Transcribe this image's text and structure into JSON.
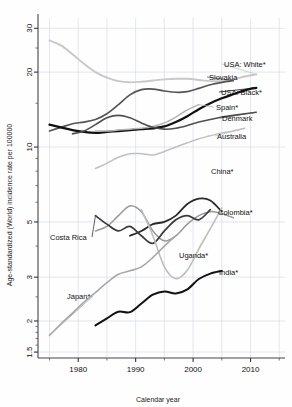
{
  "figure": {
    "background": "#fefefe",
    "frame_color": "#444444",
    "grid_color": "#d9dde6"
  },
  "axes": {
    "x": {
      "label": "Calendar year",
      "ticks": [
        1980,
        1990,
        2000,
        2010
      ],
      "tick_labels": [
        "1980",
        "1990",
        "2000",
        "2010"
      ],
      "minor_gridlines": [
        1975,
        1980,
        1985,
        1990,
        1995,
        2000,
        2005,
        2010,
        2015
      ],
      "range": [
        1973,
        2016
      ]
    },
    "y": {
      "label": "Age-standardized (World) incidence rate per 100000",
      "scale": "log",
      "ticks": [
        1.5,
        2,
        3,
        5,
        10,
        20,
        30
      ],
      "tick_labels": [
        "1.5",
        "2",
        "3",
        "5",
        "10",
        "20",
        "30"
      ],
      "range": [
        1.42,
        33
      ]
    }
  },
  "chart_data": {
    "type": "line",
    "title": "",
    "xlabel": "Calendar year",
    "ylabel": "Age-standardized (World) incidence rate per 100000",
    "xlim": [
      1973,
      2016
    ],
    "ylim": [
      1.42,
      33
    ],
    "yscale": "log",
    "grid": true,
    "legend": "inline-labels-at-line-ends",
    "series": [
      {
        "name": "USA: White*",
        "label": "USA: White*",
        "color": "#c8c8c8",
        "width": 1.9,
        "label_xy": [
          224,
          64
        ],
        "x": [
          1975,
          1977,
          1979,
          1981,
          1983,
          1985,
          1987,
          1989,
          1991,
          1993,
          1995,
          1997,
          1999,
          2001,
          2003,
          2005,
          2007,
          2009,
          2011
        ],
        "y": [
          26.8,
          25.6,
          23.6,
          21.6,
          20.0,
          19.0,
          18.4,
          18.2,
          18.3,
          18.5,
          18.7,
          18.8,
          18.8,
          18.6,
          18.4,
          18.4,
          18.7,
          19.2,
          19.6
        ]
      },
      {
        "name": "Slovakia",
        "label": "Slovakia",
        "color": "#555555",
        "width": 1.7,
        "label_xy": [
          209,
          77
        ],
        "x": [
          1975,
          1977,
          1979,
          1981,
          1983,
          1985,
          1987,
          1989,
          1991,
          1993,
          1995,
          1997,
          1999,
          2001,
          2003,
          2005,
          2007
        ],
        "y": [
          11.6,
          12.0,
          12.4,
          12.6,
          12.9,
          13.6,
          14.8,
          16.2,
          17.0,
          17.1,
          16.8,
          16.6,
          16.7,
          17.2,
          17.8,
          18.2,
          18.5
        ]
      },
      {
        "name": "USA: Black*",
        "label": "USA: Black*",
        "color": "#111111",
        "width": 2.3,
        "label_xy": [
          221,
          92
        ],
        "x": [
          1975,
          1977,
          1979,
          1981,
          1983,
          1985,
          1987,
          1989,
          1991,
          1993,
          1995,
          1997,
          1999,
          2001,
          2003,
          2005,
          2007,
          2009,
          2011
        ],
        "y": [
          12.3,
          12.0,
          11.7,
          11.5,
          11.4,
          11.5,
          11.6,
          11.7,
          11.8,
          11.9,
          12.1,
          12.6,
          13.3,
          14.2,
          15.0,
          15.7,
          16.3,
          16.9,
          17.3
        ]
      },
      {
        "name": "Spain*",
        "label": "Spain*",
        "color": "#b4b4b4",
        "width": 1.5,
        "label_xy": [
          216,
          107
        ],
        "x": [
          1983,
          1985,
          1987,
          1989,
          1991,
          1993,
          1995,
          1997,
          1999,
          2001
        ],
        "y": [
          11.6,
          11.6,
          11.7,
          11.8,
          11.9,
          12.1,
          12.5,
          13.2,
          14.1,
          14.8
        ]
      },
      {
        "name": "Denmark",
        "label": "Denmark",
        "color": "#4f4f4f",
        "width": 1.6,
        "label_xy": [
          222,
          118
        ],
        "x": [
          1979,
          1981,
          1983,
          1985,
          1987,
          1989,
          1991,
          1993,
          1995,
          1997,
          1999,
          2001,
          2003,
          2005,
          2007,
          2009,
          2011
        ],
        "y": [
          11.3,
          11.6,
          12.3,
          13.1,
          13.4,
          13.1,
          12.5,
          12.0,
          11.8,
          11.9,
          12.2,
          12.6,
          12.9,
          13.2,
          13.4,
          13.6,
          13.8
        ]
      },
      {
        "name": "Australia",
        "label": "Australia",
        "color": "#c0c0c0",
        "width": 1.5,
        "label_xy": [
          217,
          136
        ],
        "x": [
          1983,
          1985,
          1987,
          1989,
          1991,
          1993,
          1995,
          1997,
          1999,
          2001,
          2003,
          2005,
          2007,
          2009
        ],
        "y": [
          8.2,
          8.6,
          9.1,
          9.4,
          9.4,
          9.3,
          9.6,
          10.0,
          10.4,
          10.8,
          11.1,
          11.4,
          11.6,
          11.9
        ]
      },
      {
        "name": "China*",
        "label": "China*",
        "color": "#2a2a2a",
        "width": 1.8,
        "label_xy": [
          211,
          171
        ],
        "x": [
          1989,
          1991,
          1993,
          1995,
          1997,
          1999,
          2001,
          2003,
          2005
        ],
        "y": [
          4.4,
          4.6,
          4.9,
          5.0,
          5.3,
          5.9,
          6.2,
          6.1,
          5.5
        ]
      },
      {
        "name": "Colombia*",
        "label": "Colombia*",
        "color": "#9a9a9a",
        "width": 1.5,
        "label_xy": [
          218,
          212
        ],
        "x": [
          1983,
          1985,
          1987,
          1989,
          1991,
          1993,
          1995,
          1997,
          1999,
          2001,
          2003,
          2005,
          2007
        ],
        "y": [
          4.6,
          4.8,
          5.3,
          5.8,
          5.5,
          4.6,
          4.2,
          4.4,
          4.9,
          5.3,
          5.5,
          5.4,
          5.2
        ]
      },
      {
        "name": "Costa Rica",
        "label": "Costa Rica",
        "color": "#3a3a3a",
        "width": 1.7,
        "label_xy": [
          50,
          237
        ],
        "x": [
          1983,
          1985,
          1987,
          1989,
          1991,
          1993,
          1995,
          1997,
          1999,
          2001,
          2003
        ],
        "y": [
          5.3,
          4.9,
          4.6,
          4.8,
          4.4,
          4.1,
          4.6,
          5.1,
          5.3,
          5.1,
          5.6
        ]
      },
      {
        "name": "Uganda*",
        "label": "Uganda*",
        "color": "#bdbdbd",
        "width": 1.6,
        "label_xy": [
          179,
          255
        ],
        "x": [
          1991,
          1993,
          1995,
          1997,
          1999,
          2001,
          2003,
          2005
        ],
        "y": [
          5.6,
          4.4,
          3.3,
          2.96,
          3.2,
          3.9,
          4.7,
          5.7
        ]
      },
      {
        "name": "India*",
        "label": "India*",
        "color": "#111111",
        "width": 2.0,
        "label_xy": [
          219,
          272
        ],
        "x": [
          1983,
          1985,
          1987,
          1989,
          1991,
          1993,
          1995,
          1997,
          1999,
          2001,
          2003,
          2005
        ],
        "y": [
          1.92,
          2.05,
          2.18,
          2.17,
          2.35,
          2.55,
          2.63,
          2.58,
          2.68,
          2.95,
          3.1,
          3.18
        ]
      },
      {
        "name": "Japan*",
        "label": "Japan*",
        "color": "#a8a8a8",
        "width": 1.6,
        "label_xy": [
          67,
          296
        ],
        "x": [
          1975,
          1977,
          1979,
          1981,
          1983,
          1985,
          1987,
          1989,
          1991,
          1993,
          1995,
          1997
        ],
        "y": [
          1.75,
          1.95,
          2.15,
          2.38,
          2.6,
          2.85,
          3.08,
          3.18,
          3.3,
          3.6,
          4.0,
          4.4
        ]
      }
    ]
  }
}
